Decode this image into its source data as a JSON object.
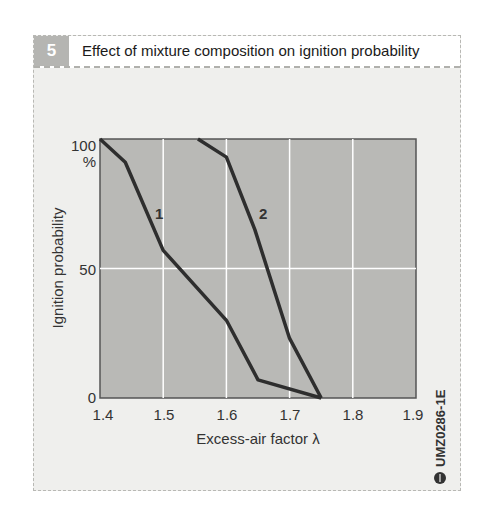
{
  "figure": {
    "number": "5",
    "title": "Effect of mixture composition on ignition probability",
    "code": "UMZ0286-1E",
    "code_icon": "bosch-logo-icon"
  },
  "colors": {
    "plot_bg": "#b9b9b6",
    "curve": "#2e2e2e",
    "grid": "#ffffff",
    "frame_bg": "#efefed",
    "number_tab": "#b5b5b2"
  },
  "axes": {
    "ylabel": "Ignition probability",
    "yunit": "%",
    "xlabel": "Excess-air factor λ",
    "y_ticks": [
      "0",
      "50",
      "100"
    ],
    "x_ticks": [
      "1.4",
      "1.5",
      "1.6",
      "1.7",
      "1.8",
      "1.9"
    ]
  },
  "curve_labels": [
    "1",
    "2"
  ],
  "chart_data": {
    "type": "line",
    "title": "Effect of mixture composition on ignition probability",
    "xlabel": "Excess-air factor λ",
    "ylabel": "Ignition probability (%)",
    "xlim": [
      1.4,
      1.9
    ],
    "ylim": [
      0,
      100
    ],
    "x_ticks": [
      1.4,
      1.5,
      1.6,
      1.7,
      1.8,
      1.9
    ],
    "y_ticks": [
      0,
      50,
      100
    ],
    "grid": true,
    "legend": "inline labels",
    "series": [
      {
        "name": "1",
        "x": [
          1.4,
          1.44,
          1.5,
          1.6,
          1.65,
          1.75
        ],
        "y": [
          100,
          91,
          57,
          30,
          7,
          0
        ]
      },
      {
        "name": "2",
        "x": [
          1.555,
          1.6,
          1.645,
          1.7,
          1.75
        ],
        "y": [
          100,
          93,
          65,
          23,
          0
        ]
      }
    ]
  }
}
